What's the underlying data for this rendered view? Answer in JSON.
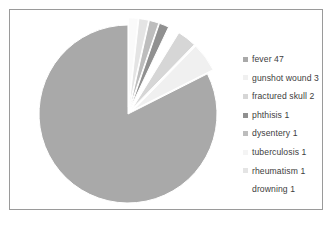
{
  "chart_data": {
    "type": "pie",
    "title": "",
    "subtitle": "",
    "xlabel": "",
    "ylabel": "",
    "grid": false,
    "legend_position": "right",
    "total": 57,
    "categories": [
      "fever",
      "gunshot wound",
      "fractured skull",
      "phthisis",
      "dysentery",
      "tuberculosis",
      "rheumatism",
      "drowning"
    ],
    "values": [
      47,
      3,
      2,
      1,
      1,
      1,
      1,
      1
    ],
    "labels": [
      "fever 47",
      "gunshot wound 3",
      "fractured skull 2",
      "phthisis 1",
      "dysentery 1",
      "tuberculosis 1",
      "rheumatism 1",
      "drowning 1"
    ],
    "slice_colors": [
      "#a9a9a9",
      "#f0f0f0",
      "#d6d6d6",
      "#ffffff",
      "#909090",
      "#bdbdbd",
      "#e4e4e4",
      "#fafafa"
    ],
    "exploded": true,
    "start_angle_deg": 90,
    "direction": "counterclockwise"
  },
  "legend": {
    "items": [
      {
        "label": "fever 47",
        "color": "#a9a9a9"
      },
      {
        "label": "gunshot wound 3",
        "color": "#f0f0f0"
      },
      {
        "label": "fractured skull 2",
        "color": "#d6d6d6"
      },
      {
        "label": "phthisis 1",
        "color": "#909090"
      },
      {
        "label": "dysentery 1",
        "color": "#bdbdbd"
      },
      {
        "label": "tuberculosis 1",
        "color": "#f4f4f4"
      },
      {
        "label": "rheumatism 1",
        "color": "#e4e4e4"
      },
      {
        "label": "drowning 1",
        "color": "#ffffff"
      }
    ]
  },
  "colors": {
    "frame_border": "#9a9a9a",
    "background": "#ffffff",
    "text": "#3d3d3d"
  }
}
